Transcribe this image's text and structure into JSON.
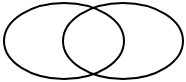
{
  "diagram": {
    "type": "venn",
    "background": "#ffffff",
    "stroke_color": "#000000",
    "stroke_width": 2,
    "sets": [
      {
        "id": "left",
        "cx": 64,
        "cy": 41,
        "rx": 60,
        "ry": 38,
        "label": ""
      },
      {
        "id": "right",
        "cx": 123,
        "cy": 41,
        "rx": 60,
        "ry": 38,
        "label": ""
      }
    ]
  }
}
